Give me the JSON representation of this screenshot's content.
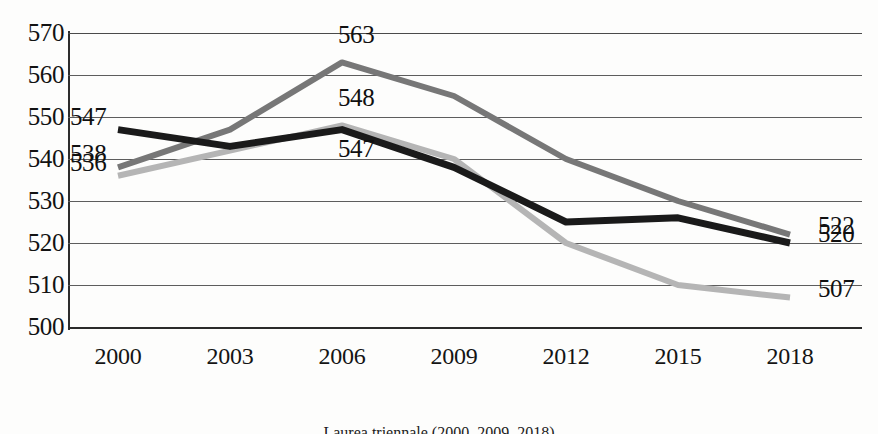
{
  "chart_data": {
    "type": "line",
    "title": "",
    "xlabel": "",
    "ylabel": "",
    "categories": [
      "2000",
      "2003",
      "2006",
      "2009",
      "2012",
      "2015",
      "2018"
    ],
    "ylim": [
      500,
      570
    ],
    "yticks": [
      "570",
      "560",
      "550",
      "540",
      "530",
      "520",
      "510",
      "500"
    ],
    "ytick_values": [
      570,
      560,
      550,
      540,
      530,
      520,
      510,
      500
    ],
    "grid": true,
    "legend": "none",
    "series": [
      {
        "name": "series-black",
        "color": "#1a1a1a",
        "width": 7,
        "values": [
          547,
          543,
          547,
          538,
          525,
          526,
          520
        ]
      },
      {
        "name": "series-dark-gray",
        "color": "#777777",
        "width": 6,
        "values": [
          538,
          547,
          563,
          555,
          540,
          530,
          522
        ]
      },
      {
        "name": "series-light-gray",
        "color": "#b5b5b5",
        "width": 6,
        "values": [
          536,
          542,
          548,
          540,
          520,
          510,
          507
        ]
      }
    ],
    "annotations": [
      {
        "text": "547",
        "series": "series-black",
        "at": "2000",
        "position": "left"
      },
      {
        "text": "538",
        "series": "series-dark-gray",
        "at": "2000",
        "position": "left"
      },
      {
        "text": "536",
        "series": "series-light-gray",
        "at": "2000",
        "position": "left"
      },
      {
        "text": "563",
        "series": "series-dark-gray",
        "at": "2006",
        "position": "above"
      },
      {
        "text": "548",
        "series": "series-light-gray",
        "at": "2006",
        "position": "above"
      },
      {
        "text": "547",
        "series": "series-black",
        "at": "2006",
        "position": "below"
      },
      {
        "text": "522",
        "series": "series-dark-gray",
        "at": "2018",
        "position": "right"
      },
      {
        "text": "520",
        "series": "series-black",
        "at": "2018",
        "position": "right"
      },
      {
        "text": "507",
        "series": "series-light-gray",
        "at": "2018",
        "position": "right"
      }
    ]
  },
  "caption": {
    "text": "Laurea triennale (2000, 2009, 2018)"
  }
}
